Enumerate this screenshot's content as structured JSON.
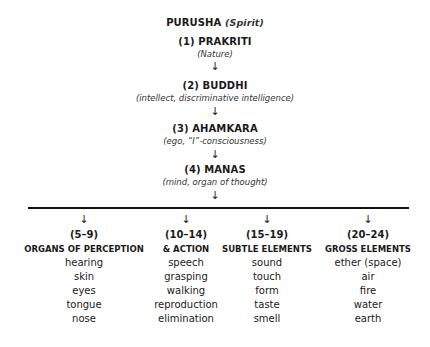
{
  "root": {
    "title": "PURUSHA",
    "gloss": "(Spirit)"
  },
  "levels": [
    {
      "label": "(1) PRAKRITI",
      "gloss": "(Nature)"
    },
    {
      "label": "(2) BUDDHI",
      "gloss": "(intellect, discriminative intelligence)"
    },
    {
      "label": "(3) AHAMKARA",
      "gloss": "(ego, “I”-consciousness)"
    },
    {
      "label": "(4) MANAS",
      "gloss": "(mind, organ of thought)"
    }
  ],
  "arrow_glyph": "↓",
  "columns": [
    {
      "range": "(5–9)",
      "heading": "ORGANS OF PERCEPTION",
      "items": [
        "hearing",
        "skin",
        "eyes",
        "tongue",
        "nose"
      ]
    },
    {
      "range": "(10–14)",
      "heading": "& ACTION",
      "items": [
        "speech",
        "grasping",
        "walking",
        "reproduction",
        "elimination"
      ]
    },
    {
      "range": "(15–19)",
      "heading": "SUBTLE ELEMENTS",
      "items": [
        "sound",
        "touch",
        "form",
        "taste",
        "smell"
      ]
    },
    {
      "range": "(20–24)",
      "heading": "GROSS ELEMENTS",
      "items": [
        "ether (space)",
        "air",
        "fire",
        "water",
        "earth"
      ]
    }
  ]
}
